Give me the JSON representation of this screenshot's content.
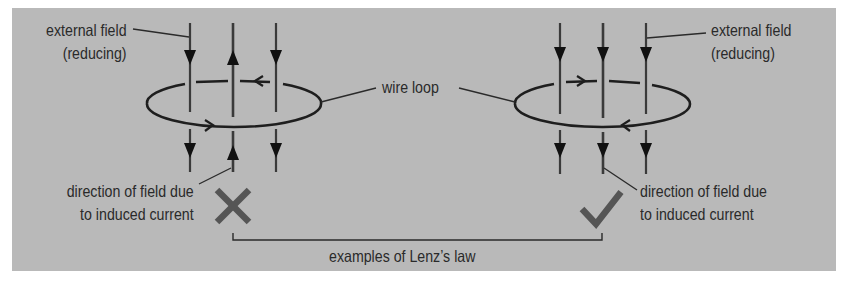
{
  "diagram": {
    "colors": {
      "background": "#b9b9b9",
      "page": "#ffffff",
      "lines": "#1e1e1e",
      "field_lines": "#3a3a3a",
      "mark": "#555555",
      "text": "#2a2a2a"
    },
    "left_example": {
      "external_field_label": [
        "external field",
        "(reducing)"
      ],
      "induced_field_label": [
        "direction of field due",
        "to induced current"
      ],
      "verdict": "incorrect",
      "verdict_icon": "cross-icon",
      "external_field_direction": "down",
      "induced_field_direction": "up",
      "loop_current": "counter-clockwise viewed from above (front arrow right, back arrow left)"
    },
    "right_example": {
      "external_field_label": [
        "external field",
        "(reducing)"
      ],
      "induced_field_label": [
        "direction of field due",
        "to induced current"
      ],
      "verdict": "correct",
      "verdict_icon": "check-icon",
      "external_field_direction": "down",
      "induced_field_direction": "down",
      "loop_current": "clockwise viewed from above (back arrow right, front arrow left)"
    },
    "wire_loop_label": "wire loop",
    "bracket_label": "examples of Lenz’s law"
  }
}
